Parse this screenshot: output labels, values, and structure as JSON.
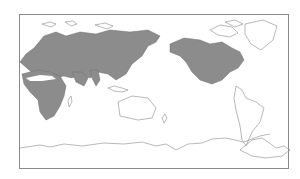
{
  "map": {
    "type": "world distribution map",
    "projection": "Pacific-centered equirectangular",
    "colors": {
      "background": "#ffffff",
      "land_outline": "#7a7a7a",
      "range_fill": "#8c8c8c",
      "frame": "#8a8a8a"
    },
    "regions_shaded": [
      "Europe",
      "Africa",
      "Asia",
      "North America"
    ],
    "legend": null,
    "labels": []
  }
}
